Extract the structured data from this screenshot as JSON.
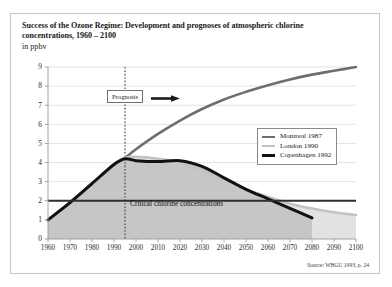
{
  "figure": {
    "title": "Success of the Ozone Regime: Development and prognoses of atmospheric chlorine concentrations, 1960 – 2100",
    "subtitle": "in ppbv",
    "source": "Source: WBGU 1993, p. 24"
  },
  "annotations": {
    "prognosis_label": "Prognosis",
    "prognosis_year": 1995,
    "critical_label": "Critical chlorine concentrations",
    "critical_value": 2
  },
  "legend": {
    "position": "inside-right",
    "items": [
      {
        "label": "Montreal 1987",
        "color": "#6e6e6e",
        "width": 2.6
      },
      {
        "label": "London 1990",
        "color": "#c2c2c2",
        "width": 2.6
      },
      {
        "label": "Copenhagen 1992",
        "color": "#111111",
        "width": 3.0
      }
    ]
  },
  "colors": {
    "montreal": "#6e6e6e",
    "london": "#c2c2c2",
    "copenhagen": "#111111",
    "fill_london": "#e2e2e2",
    "fill_copenhagen": "#c6c6c6",
    "grid": "#dcdcdc",
    "axis": "#9a9a9a",
    "frame": "#c9c6c0",
    "critical_line": "#2f2f2f"
  },
  "chart_data": {
    "type": "line",
    "title": "Success of the Ozone Regime: Development and prognoses of atmospheric chlorine concentrations, 1960 – 2100",
    "subtitle": "in ppbv",
    "xlabel": "",
    "ylabel": "ppbv",
    "xlim": [
      1960,
      2100
    ],
    "ylim": [
      0,
      9
    ],
    "grid": true,
    "xticks": [
      1960,
      1970,
      1980,
      1990,
      2000,
      2010,
      2020,
      2030,
      2040,
      2050,
      2060,
      2070,
      2080,
      2090,
      2100
    ],
    "yticks": [
      0,
      1,
      2,
      3,
      4,
      5,
      6,
      7,
      8,
      9
    ],
    "series": [
      {
        "name": "Montreal 1987",
        "color": "#6e6e6e",
        "x": [
          1960,
          1970,
          1980,
          1990,
          1995,
          2000,
          2010,
          2020,
          2030,
          2040,
          2050,
          2060,
          2070,
          2080,
          2090,
          2100
        ],
        "values": [
          1.0,
          1.9,
          2.9,
          3.9,
          4.25,
          4.7,
          5.5,
          6.2,
          6.8,
          7.3,
          7.7,
          8.05,
          8.35,
          8.6,
          8.8,
          9.0
        ]
      },
      {
        "name": "London 1990",
        "color": "#c2c2c2",
        "x": [
          1960,
          1970,
          1980,
          1990,
          1995,
          2000,
          2010,
          2020,
          2030,
          2040,
          2050,
          2060,
          2070,
          2080,
          2090,
          2100
        ],
        "values": [
          1.0,
          1.9,
          2.9,
          3.9,
          4.25,
          4.3,
          4.2,
          4.0,
          3.6,
          3.1,
          2.6,
          2.2,
          1.85,
          1.6,
          1.4,
          1.25
        ]
      },
      {
        "name": "Copenhagen 1992",
        "color": "#111111",
        "x": [
          1960,
          1970,
          1980,
          1990,
          1995,
          2000,
          2010,
          2020,
          2030,
          2040,
          2050,
          2060,
          2070,
          2080
        ],
        "values": [
          1.0,
          1.9,
          2.9,
          3.9,
          4.2,
          4.1,
          4.05,
          4.1,
          3.8,
          3.2,
          2.6,
          2.1,
          1.6,
          1.1
        ]
      }
    ],
    "reference_lines": [
      {
        "axis": "y",
        "value": 2,
        "label": "Critical chlorine concentrations",
        "color": "#2f2f2f"
      },
      {
        "axis": "x",
        "value": 1995,
        "label": "Prognosis",
        "style": "dotted"
      }
    ],
    "annotations": [
      {
        "text": "Prognosis",
        "x": 1995,
        "y": 8.1
      },
      {
        "text": "Critical chlorine concentrations",
        "x": 2005,
        "y": 2.35
      }
    ],
    "source": "Source: WBGU 1993, p. 24"
  }
}
